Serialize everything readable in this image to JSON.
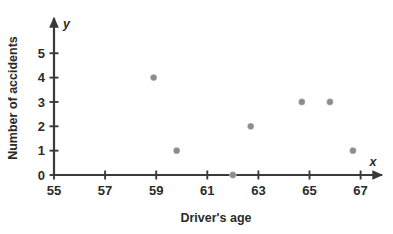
{
  "chart_data": {
    "type": "scatter",
    "title": "",
    "xlabel": "Driver's age",
    "ylabel": "Number of accidents",
    "x_axis_letter": "x",
    "y_axis_letter": "y",
    "xlim": [
      55,
      68
    ],
    "ylim": [
      0,
      5.3
    ],
    "xticks": [
      55,
      57,
      59,
      61,
      63,
      65,
      67
    ],
    "yticks": [
      0,
      1,
      2,
      3,
      4,
      5
    ],
    "xtick_labels": [
      "55",
      "57",
      "59",
      "61",
      "63",
      "65",
      "67"
    ],
    "ytick_labels": [
      "0",
      "1",
      "2",
      "3",
      "4",
      "5"
    ],
    "grid": false,
    "legend": "none",
    "point_color": "#8c8c8c",
    "axis_color": "#3a3a3a",
    "points": [
      {
        "x": 58.9,
        "y": 4
      },
      {
        "x": 59.8,
        "y": 1
      },
      {
        "x": 62.0,
        "y": 0
      },
      {
        "x": 62.7,
        "y": 2
      },
      {
        "x": 64.7,
        "y": 3
      },
      {
        "x": 65.8,
        "y": 3
      },
      {
        "x": 66.7,
        "y": 1
      }
    ]
  }
}
